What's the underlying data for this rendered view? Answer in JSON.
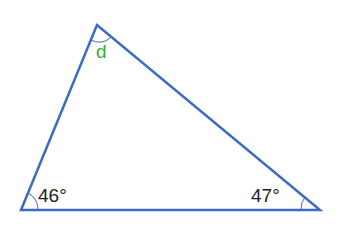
{
  "diagram": {
    "type": "triangle",
    "line_color": "#3b6cc4",
    "vertices": {
      "top": {
        "x": 97,
        "y": 25
      },
      "bottom_left": {
        "x": 21,
        "y": 210
      },
      "bottom_right": {
        "x": 320,
        "y": 210
      }
    },
    "angles": [
      {
        "vertex": "top",
        "label": "d",
        "color": "#3aaa35"
      },
      {
        "vertex": "bottom_left",
        "label": "46°",
        "color": "#222222"
      },
      {
        "vertex": "bottom_right",
        "label": "47°",
        "color": "#222222"
      }
    ]
  }
}
